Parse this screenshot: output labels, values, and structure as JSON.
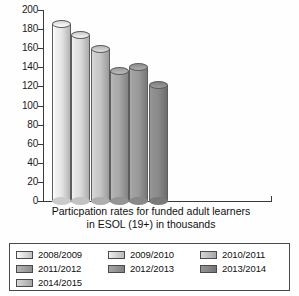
{
  "chart_data": {
    "type": "bar",
    "title": "",
    "caption_line1": "Particpation rates for funded adult learners",
    "caption_line2": "in ESOL (19+) in thousands",
    "xlabel": "",
    "ylabel": "",
    "ylim": [
      0,
      200
    ],
    "ytick_step": 20,
    "grid": false,
    "legend_position": "bottom",
    "categories": [
      "2008/2009",
      "2009/2010",
      "2010/2011",
      "2011/2012",
      "2012/2013",
      "2013/2014"
    ],
    "values": [
      190,
      178,
      163,
      140,
      145,
      126
    ],
    "ytick_labels": [
      "200",
      "180",
      "160",
      "140",
      "120",
      "100",
      "80",
      "60",
      "40",
      "20",
      "0"
    ],
    "bar_colors": [
      "#e7e7e7",
      "#dcdcdc",
      "#c6c6c6",
      "#a8a8a8",
      "#9a9a9a",
      "#8a8a8a"
    ]
  },
  "legend": {
    "items": [
      {
        "label": "2008/2009",
        "color": "#e7e7e7"
      },
      {
        "label": "2009/2010",
        "color": "#dcdcdc"
      },
      {
        "label": "2010/2011",
        "color": "#c6c6c6"
      },
      {
        "label": "2011/2012",
        "color": "#a8a8a8"
      },
      {
        "label": "2012/2013",
        "color": "#9a9a9a"
      },
      {
        "label": "2013/2014",
        "color": "#8a8a8a"
      },
      {
        "label": "2014/2015",
        "color": "#c6c6c6"
      }
    ]
  }
}
